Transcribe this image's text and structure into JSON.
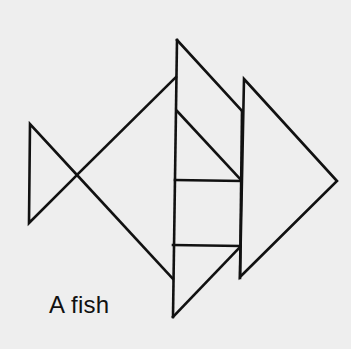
{
  "figure": {
    "caption": "A fish",
    "stroke_color": "#111111",
    "background": "#eeeeee",
    "shapes": [
      {
        "name": "tail-triangle",
        "points": [
          [
            30,
            124
          ],
          [
            29,
            223
          ],
          [
            77,
            175
          ]
        ]
      },
      {
        "name": "body-top-edge",
        "points": [
          [
            77,
            175
          ],
          [
            176,
            77
          ]
        ]
      },
      {
        "name": "body-bottom-edge",
        "points": [
          [
            77,
            175
          ],
          [
            173,
            279
          ]
        ]
      },
      {
        "name": "top-fin-triangle",
        "points": [
          [
            177,
            40
          ],
          [
            242,
            110
          ],
          [
            241,
            111
          ]
        ]
      },
      {
        "name": "middle-triangle",
        "points": [
          [
            177,
            111
          ],
          [
            241,
            180
          ]
        ]
      },
      {
        "name": "bottom-triangle",
        "points": [
          [
            173,
            317
          ],
          [
            240,
            248
          ]
        ]
      },
      {
        "name": "right-head-triangle",
        "points": [
          [
            244,
            79
          ],
          [
            337,
            181
          ],
          [
            240,
            277
          ]
        ]
      }
    ]
  }
}
